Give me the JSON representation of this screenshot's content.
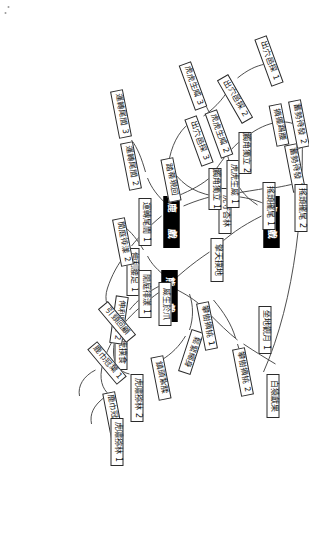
{
  "diagram": {
    "type": "mind-map",
    "orientation_degrees": 90,
    "background_color": "#ffffff",
    "root_fill": "#000000",
    "root_text_color": "#ffffff",
    "node_fill": "#ffffff",
    "node_border_color": "#2b2b2b",
    "edge_color": "#3a3a3a"
  },
  "roots": [
    {
      "id": "tiger",
      "label": "虎　戲"
    },
    {
      "id": "deer",
      "label": "鹿　戲"
    },
    {
      "id": "bear",
      "label": "熊　戲"
    }
  ],
  "branches": [
    {
      "root": "tiger",
      "chains": [
        {
          "name": "tiger-chain-upper",
          "nodes": [
            "虎守杏林",
            "出穴邑探 1",
            "出穴邑探 2",
            "出穴邑探 3",
            "踏蒂現回"
          ]
        },
        {
          "name": "tiger-chain-mid",
          "nodes": [
            "虎虎生威 3",
            "虎虎生威 2",
            "虎虎生威 1"
          ]
        },
        {
          "name": "tiger-chain-lower",
          "nodes": [
            "擎天撲地",
            "威生於爪",
            "餓虎撲食"
          ]
        }
      ]
    },
    {
      "root": "deer",
      "chains": [
        {
          "name": "deer-chain-tail",
          "nodes": [
            "運轉尾閭 1",
            "運轉尾閭 2",
            "運轉尾閭 3"
          ]
        },
        {
          "name": "deer-chain-waist",
          "nodes": [
            "伸利腰足 1",
            "伸利腰足 2"
          ]
        },
        {
          "name": "deer-chain-crown",
          "nodes": [
            "鹿巾冠葉 1",
            "鹿巾冠葉 2"
          ]
        },
        {
          "name": "deer-chain-horn",
          "nodes": [
            "觸角獨立 1",
            "觸角獨立 2",
            "摘擺踢腰"
          ]
        },
        {
          "name": "deer-chain-prepare",
          "nodes": [
            "蓄勢待發 1",
            "蓄勢待發 2"
          ]
        },
        {
          "name": "deer-chain-shake",
          "nodes": [
            "搖頭擺尾 1",
            "搖頭擺尾 2"
          ]
        }
      ]
    },
    {
      "root": "bear",
      "chains": [
        {
          "name": "bear-chain-sway",
          "nodes": [
            "閒庭徘漾 1",
            "閒庭徘漾 2"
          ]
        },
        {
          "name": "bear-chain-body",
          "nodes": [
            "鬆緊縮身",
            "鎮頭紮腬"
          ]
        },
        {
          "name": "bear-chain-pick",
          "nodes": [
            "攀樹摘桃 1",
            "攀樹摘桃 2"
          ]
        },
        {
          "name": "bear-chain-moon",
          "nodes": [
            "坐地觀月 1",
            "白猿獻果"
          ]
        },
        {
          "name": "bear-chain-look",
          "nodes": [
            "引頸回顧"
          ]
        },
        {
          "name": "bear-chain-tiger-howl",
          "nodes": [
            "虎嘯猕林 1",
            "虎嘯猕林 2"
          ]
        }
      ]
    }
  ],
  "nodes": [
    {
      "id": "n-tiger-root",
      "label": "虎　戲",
      "kind": "root"
    },
    {
      "id": "n-deer-root",
      "label": "鹿　戲",
      "kind": "root"
    },
    {
      "id": "n-bear-root",
      "label": "熊　戲",
      "kind": "root"
    },
    {
      "id": "n-hsou",
      "label": "虎守杏林",
      "kind": "leaf"
    },
    {
      "id": "n-chu1",
      "label": "出穴邑探 1",
      "kind": "leaf"
    },
    {
      "id": "n-chu2",
      "label": "出穴邑探 2",
      "kind": "leaf"
    },
    {
      "id": "n-chu3",
      "label": "出穴邑探 3",
      "kind": "leaf"
    },
    {
      "id": "n-tadi",
      "label": "踏蒂現回",
      "kind": "leaf"
    },
    {
      "id": "n-hu1",
      "label": "虎虎生威 1",
      "kind": "leaf"
    },
    {
      "id": "n-hu2",
      "label": "虎虎生威 2",
      "kind": "leaf"
    },
    {
      "id": "n-hu3",
      "label": "虎虎生威 3",
      "kind": "leaf"
    },
    {
      "id": "n-qing",
      "label": "擎天撲地",
      "kind": "leaf"
    },
    {
      "id": "n-wei",
      "label": "威生於爪",
      "kind": "leaf"
    },
    {
      "id": "n-ehu",
      "label": "餓虎撲食",
      "kind": "leaf"
    },
    {
      "id": "n-yun1",
      "label": "運轉尾閭 1",
      "kind": "leaf"
    },
    {
      "id": "n-yun2",
      "label": "運轉尾閭 2",
      "kind": "leaf"
    },
    {
      "id": "n-yun3",
      "label": "運轉尾閭 3",
      "kind": "leaf"
    },
    {
      "id": "n-shen1",
      "label": "伸利腰足 1",
      "kind": "leaf"
    },
    {
      "id": "n-shen2",
      "label": "伸利腰足 2",
      "kind": "leaf"
    },
    {
      "id": "n-lu1",
      "label": "鹿巾冠葉 1",
      "kind": "leaf"
    },
    {
      "id": "n-lu2",
      "label": "鹿巾冠葉 2",
      "kind": "leaf"
    },
    {
      "id": "n-horn1",
      "label": "觸角獨立 1",
      "kind": "leaf"
    },
    {
      "id": "n-horn2",
      "label": "觸角獨立 2",
      "kind": "leaf"
    },
    {
      "id": "n-yao",
      "label": "摘擺踢腰",
      "kind": "leaf"
    },
    {
      "id": "n-xu1",
      "label": "蓄勢待發 1",
      "kind": "leaf"
    },
    {
      "id": "n-xu2",
      "label": "蓄勢待發 2",
      "kind": "leaf"
    },
    {
      "id": "n-yaow1",
      "label": "搖頭擺尾 1",
      "kind": "leaf"
    },
    {
      "id": "n-yaow2",
      "label": "搖頭擺尾 2",
      "kind": "leaf"
    },
    {
      "id": "n-xian1",
      "label": "閒庭徘漾 1",
      "kind": "leaf"
    },
    {
      "id": "n-xian2",
      "label": "閒庭徘漾 2",
      "kind": "leaf"
    },
    {
      "id": "n-song",
      "label": "鬆緊縮身",
      "kind": "leaf"
    },
    {
      "id": "n-zhen",
      "label": "鎮頭紮腬",
      "kind": "leaf"
    },
    {
      "id": "n-pan1",
      "label": "攀樹摘桃 1",
      "kind": "leaf"
    },
    {
      "id": "n-pan2",
      "label": "攀樹摘桃 2",
      "kind": "leaf"
    },
    {
      "id": "n-zuo1",
      "label": "坐地觀月 1",
      "kind": "leaf"
    },
    {
      "id": "n-bai",
      "label": "白猿獻果",
      "kind": "leaf"
    },
    {
      "id": "n-yin",
      "label": "引頸回顧",
      "kind": "leaf"
    },
    {
      "id": "n-howl1",
      "label": "虎嘯猕林 1",
      "kind": "leaf"
    },
    {
      "id": "n-howl2",
      "label": "虎嘯猕林 2",
      "kind": "leaf"
    }
  ]
}
